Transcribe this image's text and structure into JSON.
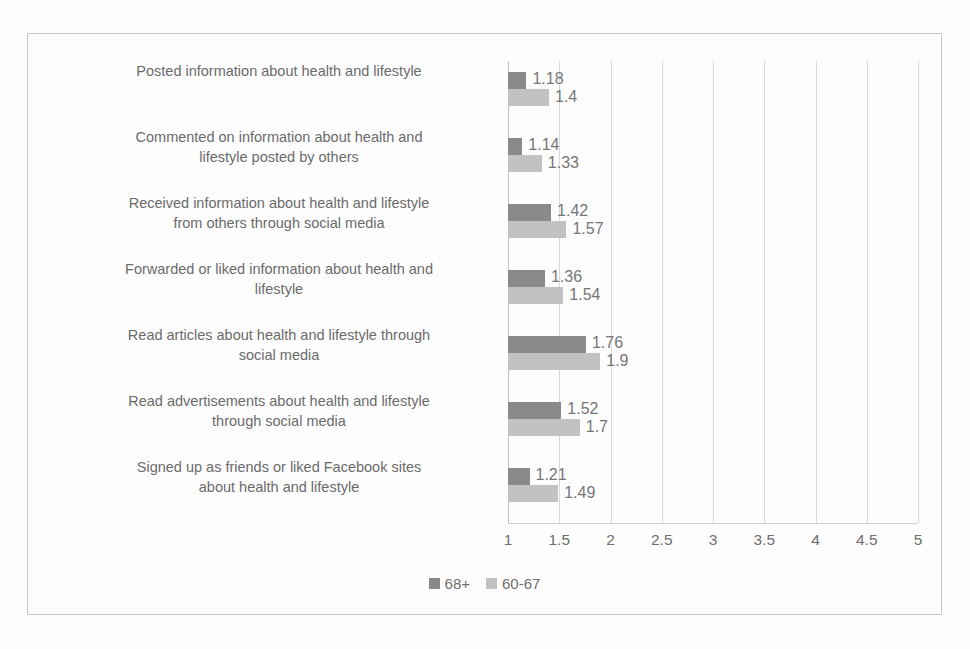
{
  "chart_data": {
    "type": "bar",
    "orientation": "horizontal",
    "title": "",
    "xlabel": "",
    "ylabel": "",
    "xlim": [
      1,
      5
    ],
    "xticks": [
      "1",
      "1.5",
      "2",
      "2.5",
      "3",
      "3.5",
      "4",
      "4.5",
      "5"
    ],
    "xtick_values": [
      1,
      1.5,
      2,
      2.5,
      3,
      3.5,
      4,
      4.5,
      5
    ],
    "grid": true,
    "legend_position": "bottom",
    "categories": [
      "Posted information about health and lifestyle",
      "Commented on information about health and\nlifestyle posted by others",
      "Received information about health and lifestyle\nfrom others through social media",
      "Forwarded or liked information about health and\nlifestyle",
      "Read articles about health and lifestyle through\nsocial media",
      "Read advertisements about health and lifestyle\nthrough social media",
      "Signed up as friends or liked Facebook sites\nabout health and lifestyle"
    ],
    "series": [
      {
        "name": "68+",
        "color": "#8a8a8a",
        "values": [
          1.18,
          1.14,
          1.42,
          1.36,
          1.76,
          1.52,
          1.21
        ],
        "labels": [
          "1.18",
          "1.14",
          "1.42",
          "1.36",
          "1.76",
          "1.52",
          "1.21"
        ]
      },
      {
        "name": "60-67",
        "color": "#c2c2c2",
        "values": [
          1.4,
          1.33,
          1.57,
          1.54,
          1.9,
          1.7,
          1.49
        ],
        "labels": [
          "1.4",
          "1.33",
          "1.57",
          "1.54",
          "1.9",
          "1.7",
          "1.49"
        ]
      }
    ]
  },
  "legend": {
    "items": [
      {
        "label": "68+",
        "color": "#8a8a8a"
      },
      {
        "label": "60-67",
        "color": "#c2c2c2"
      }
    ]
  },
  "colors": {
    "series_68plus": "#8a8a8a",
    "series_60to67": "#c2c2c2",
    "gridline": "#d8d8d8",
    "frame": "#c9c9c9",
    "text": "#6e6e6e",
    "background": "#fdfdfd"
  }
}
